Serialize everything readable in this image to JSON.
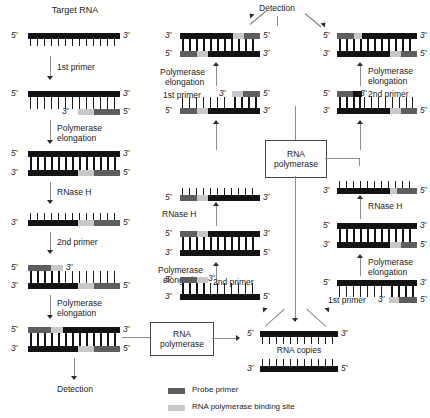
{
  "figure": {
    "colors": {
      "template_black": "#131313",
      "probe_primer_gray": "#5e5e5e",
      "polymerase_site_light": "#c8c8c8",
      "arrow_gray": "#8d8d8d",
      "background": "#ffffff"
    }
  },
  "labels": {
    "target_rna": "Target RNA",
    "first_primer": "1st primer",
    "second_primer": "2nd primer",
    "polymerase": "Polymerase",
    "elongation": "elongation",
    "rnase_h": "RNase H",
    "detection": "Detection",
    "rna_copies": "RNA copies",
    "rna_polymerase_line1": "RNA",
    "rna_polymerase_line2": "polymerase",
    "first_primer_right": "1st primer",
    "second_primer_right": "2nd primer",
    "end_5": "5'",
    "end_3": "3'"
  },
  "legend": {
    "items": [
      {
        "swatch": "#5e5e5e",
        "label": "Probe primer"
      },
      {
        "swatch": "#c8c8c8",
        "label": "RNA polymerase binding site"
      }
    ]
  },
  "columns": {
    "left": {
      "name": "initiation-cycle",
      "steps": [
        {
          "id": "target-rna",
          "caption": "Target RNA"
        },
        {
          "id": "first-primer-anneal",
          "caption": "1st primer"
        },
        {
          "id": "polymerase-elongation-1",
          "caption": "Polymerase elongation"
        },
        {
          "id": "rnase-h-digest",
          "caption": "RNase H"
        },
        {
          "id": "second-primer-anneal",
          "caption": "2nd primer"
        },
        {
          "id": "polymerase-elongation-2",
          "caption": "Polymerase elongation"
        },
        {
          "id": "detection-left",
          "caption": "Detection"
        }
      ]
    },
    "middle": {
      "name": "cyclic-phase-a",
      "steps": [
        {
          "id": "detection-top",
          "caption": "Detection"
        },
        {
          "id": "dsdna-product-mid",
          "caption": ""
        },
        {
          "id": "polymerase-elongation-mid",
          "caption": "Polymerase elongation"
        },
        {
          "id": "first-primer-mid",
          "caption": "1st primer"
        },
        {
          "id": "rna-strand-mid",
          "caption": ""
        },
        {
          "id": "rnase-h-mid",
          "caption": "RNase H"
        },
        {
          "id": "duplex-mid",
          "caption": ""
        },
        {
          "id": "second-primer-mid",
          "caption": "2nd primer"
        }
      ]
    },
    "right": {
      "name": "cyclic-phase-b",
      "steps": [
        {
          "id": "dsdna-product-right",
          "caption": ""
        },
        {
          "id": "polymerase-elongation-r1",
          "caption": "Polymerase elongation"
        },
        {
          "id": "second-primer-right",
          "caption": "2nd primer"
        },
        {
          "id": "rna-strand-right",
          "caption": ""
        },
        {
          "id": "rnase-h-right",
          "caption": "RNase H"
        },
        {
          "id": "duplex-right",
          "caption": ""
        },
        {
          "id": "polymerase-elongation-r2",
          "caption": "Polymerase elongation"
        },
        {
          "id": "first-primer-right",
          "caption": "1st primer"
        }
      ]
    },
    "center_output": {
      "name": "rna-copies",
      "caption": "RNA copies"
    }
  },
  "boxes": [
    {
      "id": "rna-polymerase-box-upper",
      "line1": "RNA",
      "line2": "polymerase"
    },
    {
      "id": "rna-polymerase-box-lower",
      "line1": "RNA",
      "line2": "polymerase"
    }
  ]
}
